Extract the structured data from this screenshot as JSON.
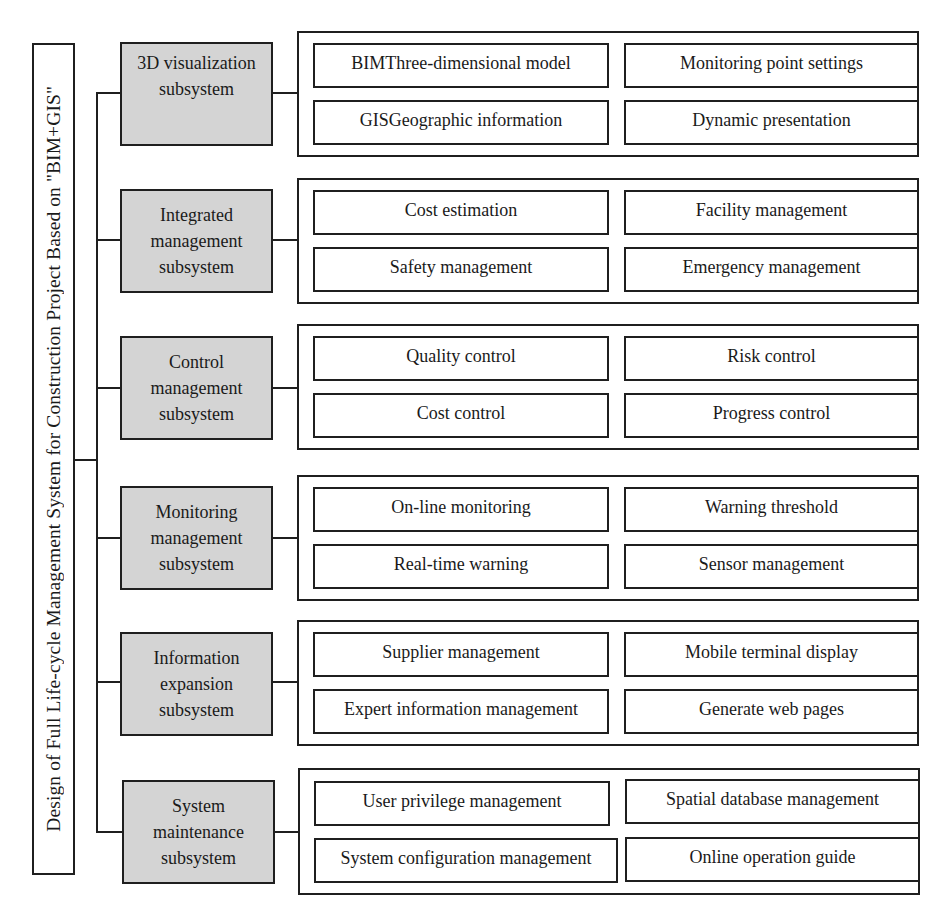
{
  "title": "Design of Full Life-cycle Management System for Construction Project Based on \"BIM+GIS\"",
  "colors": {
    "subsystem_fill": "#d4d4d4",
    "line": "#1f1f1f",
    "background": "#ffffff"
  },
  "subsystems": [
    {
      "name_lines": [
        "3D visualization",
        "subsystem"
      ],
      "items": [
        "BIMThree-dimensional model",
        "Monitoring point settings",
        "GISGeographic information",
        "Dynamic presentation"
      ]
    },
    {
      "name_lines": [
        "Integrated",
        "management",
        "subsystem"
      ],
      "items": [
        "Cost estimation",
        "Facility management",
        "Safety management",
        "Emergency management"
      ]
    },
    {
      "name_lines": [
        "Control",
        "management",
        "subsystem"
      ],
      "items": [
        "Quality control",
        "Risk control",
        "Cost control",
        "Progress control"
      ]
    },
    {
      "name_lines": [
        "Monitoring",
        "management",
        "subsystem"
      ],
      "items": [
        "On-line monitoring",
        "Warning threshold",
        "Real-time warning",
        "Sensor management"
      ]
    },
    {
      "name_lines": [
        "Information",
        "expansion",
        "subsystem"
      ],
      "items": [
        "Supplier management",
        "Mobile terminal display",
        "Expert information management",
        "Generate web pages"
      ]
    },
    {
      "name_lines": [
        "System",
        "maintenance",
        "subsystem"
      ],
      "items": [
        "User privilege management",
        "Spatial database management",
        "System configuration management",
        "Online operation guide"
      ]
    }
  ]
}
